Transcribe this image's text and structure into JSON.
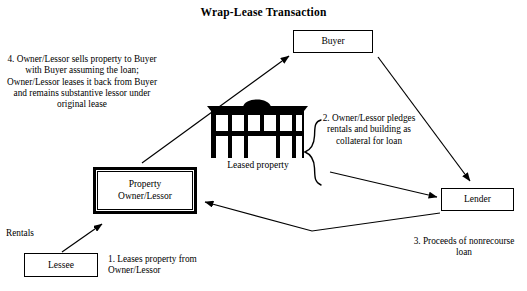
{
  "diagram": {
    "title": "Wrap-Lease Transaction",
    "background_color": "#ffffff",
    "line_color": "#000000",
    "nodes": {
      "buyer": {
        "label": "Buyer"
      },
      "lender": {
        "label": "Lender"
      },
      "lessee": {
        "label": "Lessee"
      },
      "owner": {
        "label": "Property\nOwner/Lessor",
        "line1": "Property",
        "line2": "Owner/Lessor"
      },
      "property": {
        "caption": "Leased property",
        "icon": "office-building-icon"
      }
    },
    "notes": {
      "note1": "1.  Leases property from Owner/Lessor",
      "note2": "2. Owner/Lessor pledges rentals and building as collateral for loan",
      "note3": "3.  Proceeds of nonrecourse loan",
      "note4": "4. Owner/Lessor sells property to Buyer with Buyer assuming the loan; Owner/Lessor leases it back from Buyer and remains substantive lessor under original lease",
      "rentals": "Rentals"
    },
    "connectors": [
      {
        "name": "lessee-to-owner-arrow",
        "from": "lessee",
        "to": "owner",
        "style": "solid-arrow"
      },
      {
        "name": "owner-to-buyer-arrow",
        "from": "owner",
        "to": "buyer",
        "style": "solid-arrow"
      },
      {
        "name": "buyer-to-lender-arrow",
        "from": "buyer",
        "to": "lender",
        "style": "solid-arrow"
      },
      {
        "name": "brace-to-lender-arrow",
        "from": "collateral-brace",
        "to": "lender",
        "style": "solid-arrow"
      },
      {
        "name": "lender-to-owner-arrow",
        "from": "lender",
        "to": "owner",
        "style": "bent-solid-arrow"
      },
      {
        "name": "collateral-brace",
        "from": "property",
        "to": "note2",
        "style": "curly-brace"
      }
    ]
  }
}
